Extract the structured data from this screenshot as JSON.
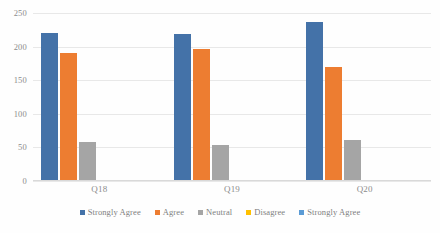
{
  "chart_data": {
    "type": "bar",
    "title": "",
    "subtitle": "",
    "xlabel": "",
    "ylabel": "",
    "categories": [
      "Q18",
      "Q19",
      "Q20"
    ],
    "series": [
      {
        "name": "Strongly Agree",
        "color": "#4472a8",
        "values": [
          220,
          219,
          237
        ]
      },
      {
        "name": "Agree",
        "color": "#ed7d31",
        "values": [
          190,
          197,
          170
        ]
      },
      {
        "name": "Neutral",
        "color": "#a5a5a5",
        "values": [
          58,
          53,
          61
        ]
      },
      {
        "name": "Disagree",
        "color": "#ffc000",
        "values": [
          2,
          1,
          2
        ]
      },
      {
        "name": "Strongly Agree",
        "color": "#5b9bd5",
        "values": [
          0,
          0,
          1
        ]
      }
    ],
    "ylim": [
      0,
      250
    ],
    "yticks": [
      0,
      50,
      100,
      150,
      200,
      250
    ],
    "ytick_labels": [
      "0",
      "50",
      "100",
      "150",
      "200",
      "250"
    ],
    "grid": true,
    "grid_axis": "y",
    "legend_position": "bottom"
  }
}
